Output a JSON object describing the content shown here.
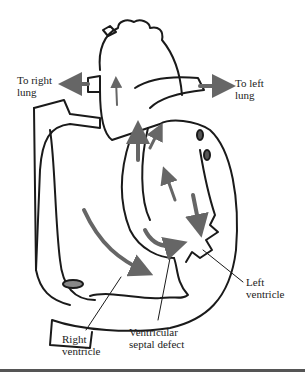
{
  "diagram": {
    "labels": {
      "to_right_lung": [
        "To right",
        "lung"
      ],
      "to_left_lung": [
        "To left",
        "lung"
      ],
      "left_ventricle": [
        "Left",
        "ventricle"
      ],
      "right_ventricle": [
        "Right",
        "ventricle"
      ],
      "vsd": [
        "Ventricular",
        "septal defect"
      ]
    },
    "colors": {
      "outline": "#1a1a1a",
      "arrow": "#666666",
      "rule": "#555555"
    }
  }
}
